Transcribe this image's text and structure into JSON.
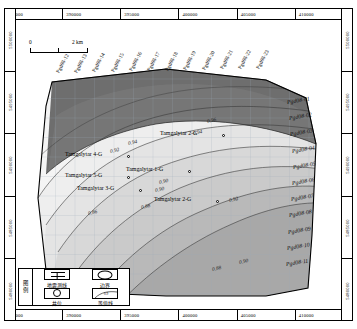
{
  "map": {
    "title": "Tamgalytar structural contour map",
    "axes": {
      "x_labels": [
        "385000",
        "390000",
        "395000",
        "400000",
        "405000",
        "410000"
      ],
      "y_labels": [
        "5500000",
        "5495000",
        "5490000",
        "5485000",
        "5480000"
      ],
      "x_unit": "m",
      "y_unit": "m"
    },
    "scalebar": {
      "start_label": "0",
      "end_label": "2 km",
      "length_km": 2
    }
  },
  "seismic_lines_top": [
    "Pgd08-12",
    "Pgd08-13",
    "Pgd08-14",
    "Pgd08-15",
    "Pgd08-16",
    "Pgd08-17",
    "Pgd08-18",
    "Pgd08-19",
    "Pgd08-20",
    "Pgd08-21",
    "Pgd08-22",
    "Pgd08-23"
  ],
  "seismic_lines_right": [
    "Pgd08-01",
    "Pgd08-02",
    "Pgd08-03",
    "Pgd08-04",
    "Pgd08-05",
    "Pgd08-06",
    "Pgd08-07",
    "Pgd08-08",
    "Pgd08-09",
    "Pgd08-10",
    "Pgd08-11"
  ],
  "wells": [
    {
      "name": "Tamgalytar 1-G",
      "x": 188,
      "y": 170
    },
    {
      "name": "Tamgalytar 2-G",
      "x": 222,
      "y": 134
    },
    {
      "name": "Tamgalytar 2-G",
      "x": 216,
      "y": 200
    },
    {
      "name": "Tamgalytar 3-G",
      "x": 139,
      "y": 189
    },
    {
      "name": "Tamgalytar 4-G",
      "x": 127,
      "y": 155
    },
    {
      "name": "Tamgalytar 5-G",
      "x": 127,
      "y": 176
    }
  ],
  "contours": [
    {
      "value": "0.96",
      "x": 207,
      "y": 117
    },
    {
      "value": "0.94",
      "x": 128,
      "y": 139
    },
    {
      "value": "0.94",
      "x": 193,
      "y": 129
    },
    {
      "value": "0.92",
      "x": 110,
      "y": 147
    },
    {
      "value": "0.92",
      "x": 229,
      "y": 196
    },
    {
      "value": "0.90",
      "x": 159,
      "y": 178
    },
    {
      "value": "0.90",
      "x": 155,
      "y": 186
    },
    {
      "value": "0.90",
      "x": 239,
      "y": 258
    },
    {
      "value": "0.88",
      "x": 141,
      "y": 203
    },
    {
      "value": "0.88",
      "x": 212,
      "y": 265
    },
    {
      "value": "0.86",
      "x": 88,
      "y": 209
    }
  ],
  "legend": {
    "title_chars": [
      "图",
      "例"
    ],
    "items": [
      {
        "icon": "seismic-line-icon",
        "label": "地震测线"
      },
      {
        "icon": "boundary-icon",
        "label": "边界"
      },
      {
        "icon": "well-icon",
        "label": "井位"
      },
      {
        "icon": "contour-icon",
        "label": "等值线"
      }
    ]
  },
  "colors": {
    "band_01": "#6f6f6f",
    "band_02": "#8d8d8d",
    "band_03": "#a2a2a2",
    "band_04": "#b4b4b4",
    "band_05": "#c3c3c3",
    "band_06": "#d0d0d0",
    "band_07": "#dadada",
    "band_08": "#e3e3e3",
    "band_09": "#ebebeb",
    "band_10": "#f2f2f2",
    "grid": "#9aa6b4",
    "outline": "#000000"
  }
}
